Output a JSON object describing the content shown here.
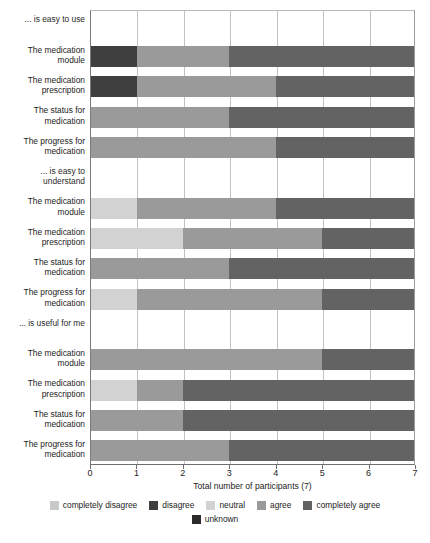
{
  "chart_data": {
    "type": "bar",
    "orientation": "horizontal",
    "stacked": true,
    "title": "",
    "xlabel": "Total number of participants (7)",
    "ylabel": "",
    "xlim": [
      0,
      7
    ],
    "xticks": [
      0,
      1,
      2,
      3,
      4,
      5,
      6,
      7
    ],
    "xtick_labels": [
      "0",
      "1",
      "2",
      "3",
      "4",
      "5",
      "6",
      "7"
    ],
    "grid": true,
    "legend_position": "bottom",
    "series": [
      {
        "name": "completely disagree",
        "color": "#c9c9c9",
        "values": [
          0,
          0,
          0,
          0,
          0,
          0,
          0,
          0,
          0,
          0,
          0,
          0
        ]
      },
      {
        "name": "disagree",
        "color": "#3f3f3f",
        "values": [
          1,
          1,
          0,
          0,
          0,
          0,
          0,
          0,
          0,
          0,
          0,
          0
        ]
      },
      {
        "name": "neutral",
        "color": "#d2d2d2",
        "values": [
          0,
          0,
          0,
          0,
          1,
          2,
          0,
          1,
          0,
          1,
          0,
          0
        ]
      },
      {
        "name": "agree",
        "color": "#9a9a9a",
        "values": [
          2,
          3,
          3,
          4,
          3,
          3,
          3,
          4,
          5,
          1,
          2,
          3
        ]
      },
      {
        "name": "completely agree",
        "color": "#636363",
        "values": [
          4,
          3,
          4,
          3,
          3,
          2,
          4,
          2,
          2,
          5,
          5,
          4
        ]
      },
      {
        "name": "unknown",
        "color": "#2b2b2b",
        "values": [
          0,
          0,
          0,
          0,
          0,
          0,
          0,
          0,
          0,
          0,
          0,
          0
        ]
      }
    ],
    "groups": [
      {
        "header": "... is easy to use",
        "categories": [
          "The medication\nmodule",
          "The medication\nprescription",
          "The status for\nmedication",
          "The progress for\nmedication"
        ]
      },
      {
        "header": "... is easy to\nunderstand",
        "categories": [
          "The medication\nmodule",
          "The medication\nprescription",
          "The status for\nmedication",
          "The progress for\nmedication"
        ]
      },
      {
        "header": "... is useful for me",
        "categories": [
          "The medication\nmodule",
          "The medication\nprescription",
          "The status for\nmedication",
          "The progress for\nmedication"
        ]
      }
    ],
    "rows": [
      {
        "group": 0,
        "label": "The medication\nmodule",
        "segments": [
          {
            "series": "disagree",
            "value": 1
          },
          {
            "series": "agree",
            "value": 2
          },
          {
            "series": "completely agree",
            "value": 4
          }
        ]
      },
      {
        "group": 0,
        "label": "The medication\nprescription",
        "segments": [
          {
            "series": "disagree",
            "value": 1
          },
          {
            "series": "agree",
            "value": 3
          },
          {
            "series": "completely agree",
            "value": 3
          }
        ]
      },
      {
        "group": 0,
        "label": "The status for\nmedication",
        "segments": [
          {
            "series": "agree",
            "value": 3
          },
          {
            "series": "completely agree",
            "value": 4
          }
        ]
      },
      {
        "group": 0,
        "label": "The progress for\nmedication",
        "segments": [
          {
            "series": "agree",
            "value": 4
          },
          {
            "series": "completely agree",
            "value": 3
          }
        ]
      },
      {
        "group": 1,
        "label": "The medication\nmodule",
        "segments": [
          {
            "series": "neutral",
            "value": 1
          },
          {
            "series": "agree",
            "value": 3
          },
          {
            "series": "completely agree",
            "value": 3
          }
        ]
      },
      {
        "group": 1,
        "label": "The medication\nprescription",
        "segments": [
          {
            "series": "neutral",
            "value": 2
          },
          {
            "series": "agree",
            "value": 3
          },
          {
            "series": "completely agree",
            "value": 2
          }
        ]
      },
      {
        "group": 1,
        "label": "The status for\nmedication",
        "segments": [
          {
            "series": "agree",
            "value": 3
          },
          {
            "series": "completely agree",
            "value": 4
          }
        ]
      },
      {
        "group": 1,
        "label": "The progress for\nmedication",
        "segments": [
          {
            "series": "neutral",
            "value": 1
          },
          {
            "series": "agree",
            "value": 4
          },
          {
            "series": "completely agree",
            "value": 2
          }
        ]
      },
      {
        "group": 2,
        "label": "The medication\nmodule",
        "segments": [
          {
            "series": "agree",
            "value": 5
          },
          {
            "series": "completely agree",
            "value": 2
          }
        ]
      },
      {
        "group": 2,
        "label": "The medication\nprescription",
        "segments": [
          {
            "series": "neutral",
            "value": 1
          },
          {
            "series": "agree",
            "value": 1
          },
          {
            "series": "completely agree",
            "value": 5
          }
        ]
      },
      {
        "group": 2,
        "label": "The status for\nmedication",
        "segments": [
          {
            "series": "agree",
            "value": 2
          },
          {
            "series": "completely agree",
            "value": 5
          }
        ]
      },
      {
        "group": 2,
        "label": "The progress for\nmedication",
        "segments": [
          {
            "series": "agree",
            "value": 3
          },
          {
            "series": "completely agree",
            "value": 4
          }
        ]
      }
    ]
  },
  "legend": {
    "items": [
      {
        "label": "completely disagree",
        "color": "#c9c9c9"
      },
      {
        "label": "disagree",
        "color": "#3f3f3f"
      },
      {
        "label": "neutral",
        "color": "#d2d2d2"
      },
      {
        "label": "agree",
        "color": "#9a9a9a"
      },
      {
        "label": "completely agree",
        "color": "#636363"
      },
      {
        "label": "unknown",
        "color": "#2b2b2b"
      }
    ]
  }
}
